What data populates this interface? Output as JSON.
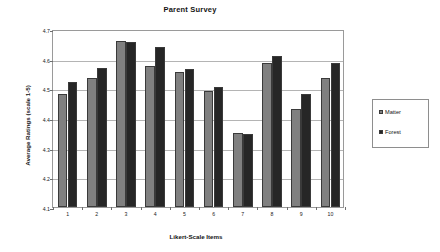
{
  "chart_data": {
    "type": "bar",
    "title": "Parent Survey",
    "xlabel": "Likert-Scale Items",
    "ylabel": "Average Ratings (scale 1-5)",
    "categories": [
      "1",
      "2",
      "3",
      "4",
      "5",
      "6",
      "7",
      "8",
      "9",
      "10"
    ],
    "series": [
      {
        "name": "Matter",
        "color": "#808080",
        "values": [
          4.48,
          4.535,
          4.66,
          4.575,
          4.555,
          4.49,
          4.35,
          4.585,
          4.43,
          4.535
        ]
      },
      {
        "name": "Forest",
        "color": "#262626",
        "values": [
          4.52,
          4.57,
          4.655,
          4.64,
          4.565,
          4.505,
          4.345,
          4.61,
          4.48,
          4.585
        ]
      }
    ],
    "ylim": [
      4.1,
      4.7
    ],
    "ytick_labels": [
      "4.7",
      "4.6",
      "4.5",
      "4.4",
      "4.3",
      "4.2",
      "4.1"
    ],
    "ytick_values": [
      4.7,
      4.6,
      4.5,
      4.4,
      4.3,
      4.2,
      4.1
    ],
    "grid": true,
    "legend_position": "right"
  },
  "legend": {
    "entries": [
      {
        "label": "Matter"
      },
      {
        "label": "Forest"
      }
    ]
  }
}
